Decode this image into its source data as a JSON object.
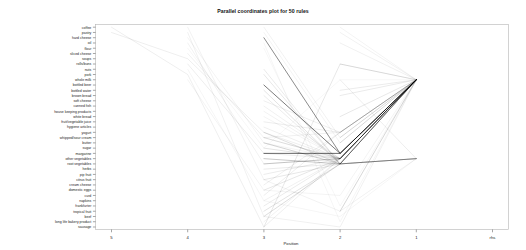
{
  "chart_data": {
    "type": "line",
    "title": "Parallel coordinates plot for 50 rules",
    "xlabel": "Position",
    "ylabel": "",
    "grid": false,
    "legend": "none",
    "x_categories": [
      "5",
      "4",
      "3",
      "2",
      "1",
      "rhs"
    ],
    "y_categories": [
      "coffee",
      "pastry",
      "hard cheese",
      "oil",
      "flour",
      "sliced cheese",
      "soups",
      "rolls/buns",
      "nuts",
      "pork",
      "whole milk",
      "bottled beer",
      "bottled water",
      "brown bread",
      "soft cheese",
      "canned fish",
      "house keeping products",
      "white bread",
      "fruit/vegetable juice",
      "hygiene articles",
      "yogurt",
      "whipped/sour cream",
      "butter",
      "sugar",
      "margarine",
      "other vegetables",
      "root vegetables",
      "herbs",
      "pip fruit",
      "citrus fruit",
      "cream cheese",
      "domestic eggs",
      "curd",
      "napkins",
      "frankfurter",
      "tropical fruit",
      "beef",
      "long life bakery product",
      "sausage"
    ],
    "series": [
      {
        "name": "rule-1",
        "shade": 0.07,
        "points": [
          [
            1,
            "flour"
          ],
          [
            2,
            "sugar"
          ],
          [
            3,
            "whole milk"
          ],
          [
            4,
            "whole milk"
          ]
        ]
      },
      {
        "name": "rule-2",
        "shade": 0.09,
        "points": [
          [
            1,
            "hard cheese"
          ],
          [
            2,
            "butter"
          ],
          [
            3,
            "other vegetables"
          ],
          [
            4,
            "whole milk"
          ]
        ]
      },
      {
        "name": "rule-3",
        "shade": 0.1,
        "points": [
          [
            1,
            "oil"
          ],
          [
            2,
            "root vegetables"
          ],
          [
            3,
            "other vegetables"
          ],
          [
            4,
            "whole milk"
          ]
        ]
      },
      {
        "name": "rule-4",
        "shade": 0.12,
        "points": [
          [
            0,
            "pastry"
          ],
          [
            1,
            "soups"
          ],
          [
            2,
            "yogurt"
          ],
          [
            3,
            "other vegetables"
          ],
          [
            4,
            "whole milk"
          ]
        ]
      },
      {
        "name": "rule-5",
        "shade": 0.11,
        "points": [
          [
            1,
            "sliced cheese"
          ],
          [
            2,
            "whipped/sour cream"
          ],
          [
            3,
            "yogurt"
          ],
          [
            4,
            "whole milk"
          ]
        ]
      },
      {
        "name": "rule-6",
        "shade": 0.13,
        "points": [
          [
            1,
            "rolls/buns"
          ],
          [
            2,
            "margarine"
          ],
          [
            3,
            "other vegetables"
          ],
          [
            4,
            "whole milk"
          ]
        ]
      },
      {
        "name": "rule-7",
        "shade": 0.15,
        "points": [
          [
            2,
            "nuts"
          ],
          [
            3,
            "root vegetables"
          ],
          [
            4,
            "other vegetables"
          ]
        ]
      },
      {
        "name": "rule-8",
        "shade": 0.16,
        "points": [
          [
            2,
            "pork"
          ],
          [
            3,
            "root vegetables"
          ],
          [
            4,
            "other vegetables"
          ]
        ]
      },
      {
        "name": "rule-9",
        "shade": 0.55,
        "points": [
          [
            2,
            "bottled beer"
          ],
          [
            3,
            "margarine"
          ],
          [
            4,
            "whole milk"
          ]
        ]
      },
      {
        "name": "rule-10",
        "shade": 0.18,
        "points": [
          [
            2,
            "bottled water"
          ],
          [
            3,
            "root vegetables"
          ],
          [
            4,
            "whole milk"
          ]
        ]
      },
      {
        "name": "rule-11",
        "shade": 0.14,
        "points": [
          [
            2,
            "brown bread"
          ],
          [
            3,
            "root vegetables"
          ],
          [
            4,
            "other vegetables"
          ]
        ]
      },
      {
        "name": "rule-12",
        "shade": 0.12,
        "points": [
          [
            2,
            "soft cheese"
          ],
          [
            3,
            "yogurt"
          ],
          [
            4,
            "whole milk"
          ]
        ]
      },
      {
        "name": "rule-13",
        "shade": 0.11,
        "points": [
          [
            2,
            "canned fish"
          ],
          [
            3,
            "other vegetables"
          ],
          [
            4,
            "whole milk"
          ]
        ]
      },
      {
        "name": "rule-14",
        "shade": 0.1,
        "points": [
          [
            2,
            "house keeping products"
          ],
          [
            3,
            "other vegetables"
          ],
          [
            4,
            "whole milk"
          ]
        ]
      },
      {
        "name": "rule-15",
        "shade": 0.09,
        "points": [
          [
            2,
            "white bread"
          ],
          [
            3,
            "other vegetables"
          ],
          [
            4,
            "whole milk"
          ]
        ]
      },
      {
        "name": "rule-16",
        "shade": 0.13,
        "points": [
          [
            2,
            "fruit/vegetable juice"
          ],
          [
            3,
            "yogurt"
          ],
          [
            4,
            "whole milk"
          ]
        ]
      },
      {
        "name": "rule-17",
        "shade": 0.12,
        "points": [
          [
            2,
            "hygiene articles"
          ],
          [
            3,
            "other vegetables"
          ],
          [
            4,
            "whole milk"
          ]
        ]
      },
      {
        "name": "rule-18",
        "shade": 0.2,
        "points": [
          [
            2,
            "yogurt"
          ],
          [
            3,
            "root vegetables"
          ],
          [
            4,
            "whole milk"
          ]
        ]
      },
      {
        "name": "rule-19",
        "shade": 0.22,
        "points": [
          [
            2,
            "whipped/sour cream"
          ],
          [
            3,
            "other vegetables"
          ],
          [
            4,
            "whole milk"
          ]
        ]
      },
      {
        "name": "rule-20",
        "shade": 0.25,
        "points": [
          [
            2,
            "butter"
          ],
          [
            3,
            "root vegetables"
          ],
          [
            4,
            "whole milk"
          ]
        ]
      },
      {
        "name": "rule-21",
        "shade": 0.18,
        "points": [
          [
            2,
            "sugar"
          ],
          [
            3,
            "other vegetables"
          ],
          [
            4,
            "whole milk"
          ]
        ]
      },
      {
        "name": "rule-22",
        "shade": 0.6,
        "points": [
          [
            2,
            "margarine"
          ],
          [
            3,
            "margarine"
          ],
          [
            4,
            "whole milk"
          ]
        ]
      },
      {
        "name": "rule-23",
        "shade": 0.3,
        "points": [
          [
            2,
            "other vegetables"
          ],
          [
            3,
            "root vegetables"
          ],
          [
            4,
            "whole milk"
          ]
        ]
      },
      {
        "name": "rule-24",
        "shade": 0.28,
        "points": [
          [
            2,
            "root vegetables"
          ],
          [
            3,
            "other vegetables"
          ],
          [
            4,
            "whole milk"
          ]
        ]
      },
      {
        "name": "rule-25",
        "shade": 0.15,
        "points": [
          [
            2,
            "herbs"
          ],
          [
            3,
            "root vegetables"
          ],
          [
            4,
            "other vegetables"
          ]
        ]
      },
      {
        "name": "rule-26",
        "shade": 0.14,
        "points": [
          [
            2,
            "pip fruit"
          ],
          [
            3,
            "other vegetables"
          ],
          [
            4,
            "whole milk"
          ]
        ]
      },
      {
        "name": "rule-27",
        "shade": 0.16,
        "points": [
          [
            2,
            "citrus fruit"
          ],
          [
            3,
            "root vegetables"
          ],
          [
            4,
            "other vegetables"
          ]
        ]
      },
      {
        "name": "rule-28",
        "shade": 0.12,
        "points": [
          [
            2,
            "cream cheese"
          ],
          [
            3,
            "yogurt"
          ],
          [
            4,
            "whole milk"
          ]
        ]
      },
      {
        "name": "rule-29",
        "shade": 0.17,
        "points": [
          [
            2,
            "domestic eggs"
          ],
          [
            3,
            "other vegetables"
          ],
          [
            4,
            "whole milk"
          ]
        ]
      },
      {
        "name": "rule-30",
        "shade": 0.13,
        "points": [
          [
            2,
            "curd"
          ],
          [
            3,
            "yogurt"
          ],
          [
            4,
            "whole milk"
          ]
        ]
      },
      {
        "name": "rule-31",
        "shade": 0.11,
        "points": [
          [
            2,
            "napkins"
          ],
          [
            3,
            "other vegetables"
          ],
          [
            4,
            "whole milk"
          ]
        ]
      },
      {
        "name": "rule-32",
        "shade": 0.14,
        "points": [
          [
            2,
            "frankfurter"
          ],
          [
            3,
            "other vegetables"
          ],
          [
            4,
            "whole milk"
          ]
        ]
      },
      {
        "name": "rule-33",
        "shade": 0.19,
        "points": [
          [
            2,
            "tropical fruit"
          ],
          [
            3,
            "root vegetables"
          ],
          [
            4,
            "other vegetables"
          ]
        ]
      },
      {
        "name": "rule-34",
        "shade": 0.21,
        "points": [
          [
            2,
            "beef"
          ],
          [
            3,
            "root vegetables"
          ],
          [
            4,
            "other vegetables"
          ]
        ]
      },
      {
        "name": "rule-35",
        "shade": 0.1,
        "points": [
          [
            2,
            "long life bakery product"
          ],
          [
            3,
            "other vegetables"
          ],
          [
            4,
            "whole milk"
          ]
        ]
      },
      {
        "name": "rule-36",
        "shade": 0.16,
        "points": [
          [
            2,
            "sausage"
          ],
          [
            3,
            "rolls/buns"
          ],
          [
            4,
            "whole milk"
          ]
        ]
      },
      {
        "name": "rule-37",
        "shade": 0.09,
        "points": [
          [
            3,
            "coffee"
          ],
          [
            4,
            "whole milk"
          ]
        ]
      },
      {
        "name": "rule-38",
        "shade": 0.1,
        "points": [
          [
            3,
            "pastry"
          ],
          [
            4,
            "whole milk"
          ]
        ]
      },
      {
        "name": "rule-39",
        "shade": 0.11,
        "points": [
          [
            3,
            "oil"
          ],
          [
            4,
            "whole milk"
          ]
        ]
      },
      {
        "name": "rule-40",
        "shade": 0.12,
        "points": [
          [
            3,
            "rolls/buns"
          ],
          [
            4,
            "whole milk"
          ]
        ]
      },
      {
        "name": "rule-41",
        "shade": 0.13,
        "points": [
          [
            3,
            "whole milk"
          ],
          [
            4,
            "other vegetables"
          ]
        ]
      },
      {
        "name": "rule-42",
        "shade": 0.14,
        "points": [
          [
            3,
            "bottled water"
          ],
          [
            4,
            "whole milk"
          ]
        ]
      },
      {
        "name": "rule-43",
        "shade": 0.15,
        "points": [
          [
            3,
            "brown bread"
          ],
          [
            4,
            "whole milk"
          ]
        ]
      },
      {
        "name": "rule-44",
        "shade": 0.16,
        "points": [
          [
            3,
            "white bread"
          ],
          [
            4,
            "whole milk"
          ]
        ]
      },
      {
        "name": "rule-45",
        "shade": 0.17,
        "points": [
          [
            3,
            "yogurt"
          ],
          [
            4,
            "whole milk"
          ]
        ]
      },
      {
        "name": "rule-46",
        "shade": 0.18,
        "points": [
          [
            3,
            "whipped/sour cream"
          ],
          [
            4,
            "whole milk"
          ]
        ]
      },
      {
        "name": "rule-47",
        "shade": 0.19,
        "points": [
          [
            3,
            "butter"
          ],
          [
            4,
            "whole milk"
          ]
        ]
      },
      {
        "name": "rule-48",
        "shade": 0.35,
        "points": [
          [
            3,
            "other vegetables"
          ],
          [
            4,
            "whole milk"
          ]
        ]
      },
      {
        "name": "rule-49",
        "shade": 0.33,
        "points": [
          [
            3,
            "root vegetables"
          ],
          [
            4,
            "whole milk"
          ]
        ]
      },
      {
        "name": "rule-50",
        "shade": 0.24,
        "points": [
          [
            3,
            "tropical fruit"
          ],
          [
            4,
            "whole milk"
          ]
        ]
      },
      {
        "name": "rule-51",
        "shade": 0.12,
        "points": [
          [
            0,
            "coffee"
          ],
          [
            1,
            "pork"
          ],
          [
            2,
            "sausage"
          ],
          [
            3,
            "other vegetables"
          ],
          [
            4,
            "whole milk"
          ]
        ]
      },
      {
        "name": "rule-52",
        "shade": 0.1,
        "points": [
          [
            1,
            "coffee"
          ],
          [
            2,
            "citrus fruit"
          ],
          [
            3,
            "tropical fruit"
          ],
          [
            4,
            "other vegetables"
          ]
        ]
      },
      {
        "name": "rule-53",
        "shade": 0.11,
        "points": [
          [
            1,
            "pastry"
          ],
          [
            2,
            "beef"
          ],
          [
            3,
            "sausage"
          ],
          [
            4,
            "whole milk"
          ]
        ]
      },
      {
        "name": "rule-54",
        "shade": 0.5,
        "points": [
          [
            2,
            "hard cheese"
          ],
          [
            3,
            "margarine"
          ],
          [
            4,
            "whole milk"
          ]
        ]
      },
      {
        "name": "rule-55",
        "shade": 0.09,
        "points": [
          [
            1,
            "whole milk"
          ],
          [
            2,
            "domestic eggs"
          ],
          [
            3,
            "curd"
          ],
          [
            4,
            "whole milk"
          ]
        ]
      },
      {
        "name": "rule-56",
        "shade": 0.08,
        "points": [
          [
            1,
            "nuts"
          ],
          [
            2,
            "napkins"
          ],
          [
            3,
            "beef"
          ],
          [
            4,
            "other vegetables"
          ]
        ]
      },
      {
        "name": "rule-57",
        "shade": 0.1,
        "points": [
          [
            2,
            "coffee"
          ],
          [
            3,
            "whipped/sour cream"
          ],
          [
            4,
            "whole milk"
          ]
        ]
      },
      {
        "name": "rule-58",
        "shade": 0.09,
        "points": [
          [
            2,
            "pastry"
          ],
          [
            3,
            "butter"
          ],
          [
            4,
            "whole milk"
          ]
        ]
      },
      {
        "name": "rule-59",
        "shade": 0.08,
        "points": [
          [
            2,
            "oil"
          ],
          [
            3,
            "long life bakery product"
          ],
          [
            4,
            "whole milk"
          ]
        ]
      },
      {
        "name": "rule-60",
        "shade": 0.07,
        "points": [
          [
            2,
            "flour"
          ],
          [
            3,
            "frankfurter"
          ],
          [
            4,
            "whole milk"
          ]
        ]
      }
    ]
  },
  "plot": {
    "title": "Parallel coordinates plot for 50 rules",
    "axis_title_x": "Position",
    "x_ticks": [
      "5",
      "4",
      "3",
      "2",
      "1",
      "rhs"
    ],
    "colors": {
      "frame": "#b4b4b4",
      "tick": "#4d4d4d",
      "line": "#000000",
      "text": "#1a1a1a",
      "background": "#ffffff"
    }
  }
}
